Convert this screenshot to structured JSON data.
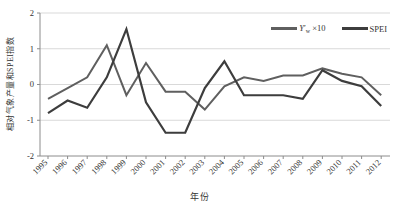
{
  "figure": {
    "ylabel": "相对气象产量和SPEI指数",
    "xlabel": "年份"
  },
  "legend": {
    "entries": [
      {
        "symbol": "Y",
        "prime": "′",
        "sub": "w",
        "suffix": " ×10"
      },
      {
        "label": "SPEI"
      }
    ]
  },
  "chart_data": {
    "type": "line",
    "title": "",
    "xlabel": "年份",
    "ylabel": "相对气象产量和SPEI指数",
    "x": [
      "1995",
      "1996",
      "1997",
      "1998",
      "1999",
      "2000",
      "2001",
      "2002",
      "2003",
      "2004",
      "2005",
      "2006",
      "2007",
      "2008",
      "2009",
      "2010",
      "2011",
      "2012"
    ],
    "series": [
      {
        "name": "Yw′ ×10",
        "color": "#5f5f5f",
        "width": 2,
        "values": [
          -0.4,
          -0.1,
          0.2,
          1.1,
          -0.3,
          0.6,
          -0.2,
          -0.2,
          -0.7,
          -0.05,
          0.2,
          0.1,
          0.25,
          0.25,
          0.45,
          0.3,
          0.2,
          -0.3
        ]
      },
      {
        "name": "SPEI",
        "color": "#3d3d3d",
        "width": 2.2,
        "values": [
          -0.8,
          -0.45,
          -0.65,
          0.2,
          1.55,
          -0.5,
          -1.35,
          -1.35,
          -0.1,
          0.65,
          -0.3,
          -0.3,
          -0.3,
          -0.4,
          0.4,
          0.1,
          -0.05,
          -0.6
        ]
      }
    ],
    "ylim": [
      -2,
      2
    ],
    "yticks": [
      "2",
      "1",
      "0",
      "-1",
      "-2"
    ],
    "grid": true,
    "legend_position": "top-right",
    "colors": {
      "gridline": "#d9d9d9",
      "axis": "#8c8c8c",
      "tick_text": "#333333"
    }
  }
}
